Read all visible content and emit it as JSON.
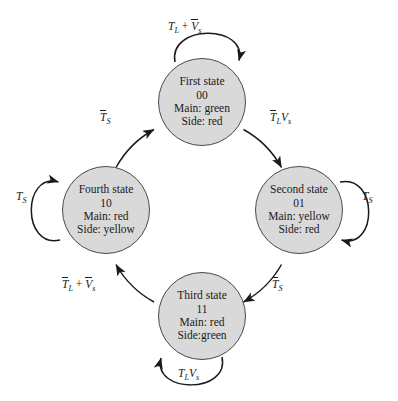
{
  "figure": {
    "type": "state-transition-diagram",
    "background_color": "#ffffff",
    "node_fill_color": "#d9d9d9",
    "node_border_color": "#4a4a4a",
    "text_color": "#1a1a1a"
  },
  "states": [
    {
      "id": "first",
      "name": "First state",
      "code": "00",
      "main": "Main: green",
      "side": "Side: red",
      "position": "top"
    },
    {
      "id": "second",
      "name": "Second state",
      "code": "01",
      "main": "Main: yellow",
      "side": "Side: red",
      "position": "right"
    },
    {
      "id": "third",
      "name": "Third state",
      "code": "11",
      "main": "Main: red",
      "side": "Side:green",
      "position": "bottom"
    },
    {
      "id": "fourth",
      "name": "Fourth state",
      "code": "10",
      "main": "Main: red",
      "side": "Side: yellow",
      "position": "left"
    }
  ],
  "transitions": [
    {
      "id": "self-first",
      "from": "first",
      "to": "first",
      "kind": "self-loop",
      "position": "top",
      "label_plain": "TL + Vs_bar",
      "terms": [
        {
          "base": "T",
          "sub": "L",
          "overbar": false
        },
        {
          "operator": "+"
        },
        {
          "base": "V",
          "sub": "s",
          "overbar": true
        }
      ]
    },
    {
      "id": "first-to-second",
      "from": "first",
      "to": "second",
      "kind": "arc",
      "position": "upper-right",
      "label_plain": "TL_bar Vs",
      "terms": [
        {
          "base": "T",
          "sub": "L",
          "overbar": true
        },
        {
          "base": "V",
          "sub": "s",
          "overbar": false
        }
      ]
    },
    {
      "id": "self-second",
      "from": "second",
      "to": "second",
      "kind": "self-loop",
      "position": "right",
      "label_plain": "Ts",
      "terms": [
        {
          "base": "T",
          "sub": "S",
          "overbar": false
        }
      ]
    },
    {
      "id": "second-to-third",
      "from": "second",
      "to": "third",
      "kind": "arc",
      "position": "lower-right",
      "label_plain": "Ts_bar",
      "terms": [
        {
          "base": "T",
          "sub": "S",
          "overbar": true
        }
      ]
    },
    {
      "id": "self-third",
      "from": "third",
      "to": "third",
      "kind": "self-loop",
      "position": "bottom",
      "label_plain": "TL Vs",
      "terms": [
        {
          "base": "T",
          "sub": "L",
          "overbar": false
        },
        {
          "base": "V",
          "sub": "s",
          "overbar": false
        }
      ]
    },
    {
      "id": "third-to-fourth",
      "from": "third",
      "to": "fourth",
      "kind": "arc",
      "position": "lower-left",
      "label_plain": "TL_bar + Vs_bar",
      "terms": [
        {
          "base": "T",
          "sub": "L",
          "overbar": true
        },
        {
          "operator": "+"
        },
        {
          "base": "V",
          "sub": "s",
          "overbar": true
        }
      ]
    },
    {
      "id": "self-fourth",
      "from": "fourth",
      "to": "fourth",
      "kind": "self-loop",
      "position": "left",
      "label_plain": "Ts",
      "terms": [
        {
          "base": "T",
          "sub": "S",
          "overbar": false
        }
      ]
    },
    {
      "id": "fourth-to-first",
      "from": "fourth",
      "to": "first",
      "kind": "arc",
      "position": "upper-left",
      "label_plain": "Ts_bar",
      "terms": [
        {
          "base": "T",
          "sub": "S",
          "overbar": true
        }
      ]
    }
  ]
}
